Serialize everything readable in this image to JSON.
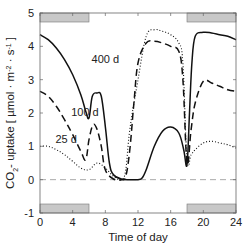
{
  "chart_data": {
    "type": "line",
    "title": "",
    "xlabel": "Time of day",
    "ylabel": "CO2- uptake [ µmol · m-2 · s-1 ]",
    "xlim": [
      0,
      24
    ],
    "ylim": [
      -1,
      5
    ],
    "xticks": [
      "0",
      "4",
      "8",
      "12",
      "16",
      "20",
      "24"
    ],
    "yticks": [
      "-1",
      "0",
      "1",
      "2",
      "3",
      "4",
      "5"
    ],
    "grid": false,
    "legend": "inline annotations",
    "dark_periods": [
      [
        0,
        6
      ],
      [
        18,
        24
      ]
    ],
    "series": [
      {
        "name": "400 d",
        "style": "solid",
        "x": [
          0,
          1,
          2,
          3,
          4,
          5,
          5.6,
          6,
          6.4,
          7,
          7.5,
          8,
          8.5,
          9,
          10,
          11,
          12,
          12.5,
          13,
          14,
          15,
          16,
          17,
          17.6,
          18,
          18.3,
          18.6,
          19,
          20,
          21,
          22,
          23,
          24
        ],
        "y": [
          4.35,
          4.2,
          3.95,
          3.6,
          3.15,
          2.55,
          2.05,
          1.85,
          2.5,
          2.6,
          2.5,
          1.6,
          0.5,
          0.15,
          0.02,
          0.0,
          0.0,
          0.05,
          0.3,
          1.0,
          1.45,
          1.58,
          1.4,
          0.9,
          0.45,
          2.0,
          3.5,
          4.3,
          4.42,
          4.4,
          4.35,
          4.3,
          4.2
        ]
      },
      {
        "name": "100 d",
        "style": "dashed",
        "x": [
          0,
          1,
          2,
          3,
          4,
          5,
          5.6,
          6,
          6.5,
          7,
          7.5,
          8,
          9,
          10,
          10.5,
          11,
          11.5,
          12,
          13,
          14,
          15,
          16,
          17,
          17.5,
          18,
          18.5,
          19,
          20,
          21,
          22,
          23,
          24
        ],
        "y": [
          2.65,
          2.5,
          2.2,
          1.8,
          1.35,
          0.85,
          0.6,
          1.2,
          1.65,
          1.5,
          1.0,
          0.3,
          0.02,
          0.0,
          0.1,
          0.9,
          2.3,
          3.5,
          4.1,
          4.15,
          4.1,
          4.0,
          3.85,
          3.0,
          0.5,
          1.5,
          2.3,
          2.95,
          2.9,
          2.8,
          2.7,
          2.65
        ]
      },
      {
        "name": "25 d",
        "style": "dotted",
        "x": [
          0,
          1,
          2,
          3,
          4,
          5,
          6,
          7,
          8,
          9,
          10,
          10.5,
          11,
          12,
          13,
          14,
          15,
          16,
          17,
          17.5,
          18,
          18.5,
          19,
          20,
          21,
          22,
          23,
          24
        ],
        "y": [
          1.0,
          1.0,
          0.9,
          0.75,
          0.55,
          0.35,
          0.3,
          0.5,
          0.35,
          0.1,
          0.0,
          0.3,
          1.5,
          3.0,
          4.3,
          4.5,
          4.45,
          4.35,
          4.1,
          3.5,
          0.6,
          0.75,
          0.9,
          1.1,
          1.15,
          1.1,
          1.05,
          0.95
        ]
      }
    ],
    "zero_line": {
      "y": 0,
      "style": "dashed",
      "color": "#aaaaaa"
    },
    "annotations": [
      {
        "text": "400 d",
        "x": 8.0,
        "y": 3.5
      },
      {
        "text": "100 d",
        "x": 5.5,
        "y": 1.9
      },
      {
        "text": "25 d",
        "x": 3.2,
        "y": 1.1
      }
    ],
    "colors": {
      "lines": "#111111",
      "dark_bar": "#c8c8c8",
      "axis": "#555555",
      "zero_line": "#aaaaaa"
    }
  }
}
